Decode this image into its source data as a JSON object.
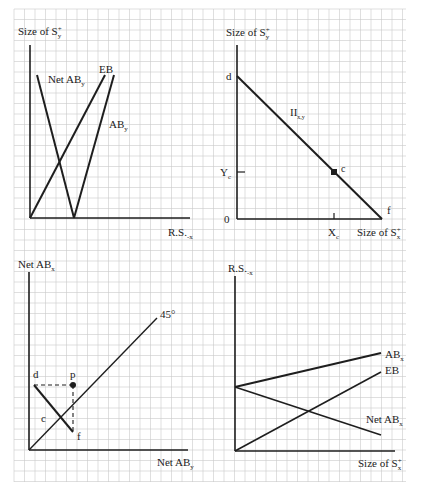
{
  "colors": {
    "background": "#ffffff",
    "grid": "#c9c9c9",
    "ink": "#1e1e1e"
  },
  "grid": {
    "x0": 14,
    "y0": 9,
    "x1": 406,
    "y1": 482,
    "step": 10.5
  },
  "panels": {
    "top_left": {
      "y_axis_label": {
        "base": "Size of S",
        "sup": "+",
        "sub": "y"
      },
      "x_axis_label": {
        "base": "R.S.",
        "sub": "-x"
      },
      "curves": [
        {
          "label": "Net AB",
          "sub": "y"
        },
        {
          "label": "EB",
          "sub": ""
        },
        {
          "label": "AB",
          "sub": "y"
        }
      ]
    },
    "top_right": {
      "y_axis_label": {
        "base": "Size of S",
        "sup": "+",
        "sub": "y"
      },
      "x_axis_label": {
        "base": "Size of S",
        "sup": "+",
        "sub": "x"
      },
      "origin_label": "0",
      "curve_label": {
        "base": "II",
        "sub": "x,y"
      },
      "point_labels": {
        "d": "d",
        "c": "c",
        "f": "f"
      },
      "tick_labels": {
        "y": {
          "base": "Y",
          "sub": "c"
        },
        "x": {
          "base": "X",
          "sub": "c"
        }
      }
    },
    "bottom_left": {
      "y_axis_label": {
        "base": "Net AB",
        "sub": "x"
      },
      "x_axis_label": {
        "base": "Net AB",
        "sub": "y"
      },
      "diagonal_label": "45°",
      "point_labels": {
        "d": "d",
        "p": "p",
        "c": "c",
        "f": "f"
      }
    },
    "bottom_right": {
      "y_axis_label": {
        "base": "R.S.",
        "sub": "-x"
      },
      "x_axis_label": {
        "base": "Size of S",
        "sup": "+",
        "sub": "x"
      },
      "curves": [
        {
          "label": "AB",
          "sub": "x"
        },
        {
          "label": "EB",
          "sub": ""
        },
        {
          "label": "Net AB",
          "sub": "x"
        }
      ]
    }
  }
}
